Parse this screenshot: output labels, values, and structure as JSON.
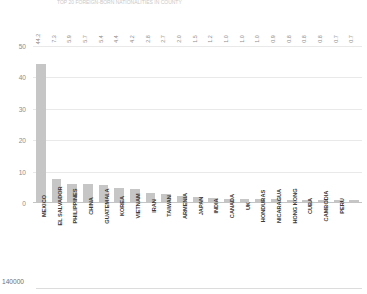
{
  "header": {
    "truncated_text": "TOP 20 FOREIGN-BORN NATIONALITIES IN COUNTY"
  },
  "chart_data": {
    "type": "bar",
    "title": "",
    "xlabel": "",
    "ylabel": "",
    "ylim": [
      0,
      50
    ],
    "yticks": [
      0,
      10,
      20,
      30,
      40,
      50
    ],
    "grid": true,
    "legend": "none",
    "orientation": "vertical",
    "bar_color": "#c6c6c6",
    "label_rotation_deg": -90,
    "categories": [
      "MEXICO",
      "EL SALVADOR",
      "PHILIPPINES",
      "CHINA",
      "GUATEMALA",
      "KOREA",
      "VIETNAM",
      "IRAN",
      "TAIWAN",
      "ARMENIA",
      "JAPAN",
      "INDIA",
      "CANADA",
      "UK",
      "HONDURAS",
      "NICARAGUA",
      "HONG KONG",
      "CUBA",
      "CAMBODIA",
      "PERU"
    ],
    "values": [
      44.2,
      7.3,
      5.9,
      5.7,
      5.4,
      4.4,
      4.2,
      2.8,
      2.7,
      2.0,
      1.5,
      1.2,
      1.0,
      1.0,
      1.0,
      0.9,
      0.8,
      0.8,
      0.8,
      0.7
    ],
    "extra_value_label": "0.7",
    "value_labels": [
      "44.2",
      "7.3",
      "5.9",
      "5.7",
      "5.4",
      "4.4",
      "4.2",
      "2.8",
      "2.7",
      "2.0",
      "1.5",
      "1.2",
      "1.0",
      "1.0",
      "1.0",
      "0.9",
      "0.8",
      "0.8",
      "0.8",
      "0.7",
      "0.7"
    ],
    "ytick_labels": [
      "50",
      "40",
      "30",
      "20",
      "10",
      "0"
    ]
  },
  "chart_below": {
    "ytick_label": "140000"
  }
}
